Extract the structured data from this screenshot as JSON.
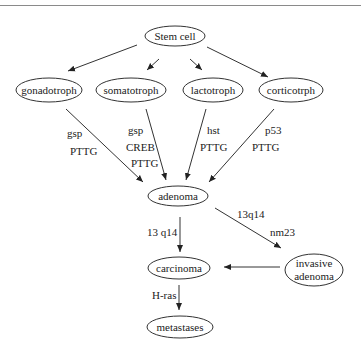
{
  "header": {
    "cropped_text": "... ... ...."
  },
  "diagram": {
    "nodes": {
      "stem_cell": "Stem cell",
      "gonadotroph": "gonadotroph",
      "somatotroph": "somatotroph",
      "lactotroph": "lactotroph",
      "corticotroph": "corticotrph",
      "adenoma": "adenoma",
      "carcinoma": "carcinoma",
      "invasive_adenoma_l1": "invasive",
      "invasive_adenoma_l2": "adenoma",
      "metastases": "metastases"
    },
    "edge_labels": {
      "gonado_1": "gsp",
      "gonado_2": "PTTG",
      "somato_1": "gsp",
      "somato_2": "CREB",
      "somato_3": "PTTG",
      "lacto_1": "hst",
      "lacto_2": "PTTG",
      "cortico_1": "p53",
      "cortico_2": "PTTG",
      "adenoma_carcinoma": "13 q14",
      "adenoma_invasive_1": "13q14",
      "adenoma_invasive_2": "nm23",
      "carcinoma_metastases": "H-ras"
    },
    "colors": {
      "stroke": "#222222",
      "background": "#ffffff"
    }
  }
}
